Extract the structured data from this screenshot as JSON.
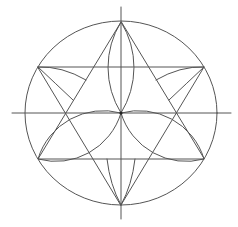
{
  "diagram": {
    "title": "",
    "colors": {
      "background": "#ffffff",
      "stroke": "#555555",
      "center_dot": "#222222"
    },
    "center": [
      121,
      113
    ],
    "circle": {
      "cx": 121,
      "cy": 113,
      "rx": 96,
      "ry": 92
    },
    "axes": {
      "horizontal": [
        12,
        113,
        231,
        113
      ],
      "vertical": [
        121,
        7,
        121,
        219
      ]
    },
    "triangle_up": [
      [
        121,
        22
      ],
      [
        38,
        159
      ],
      [
        204,
        159
      ]
    ],
    "triangle_down": [
      [
        38,
        67
      ],
      [
        204,
        67
      ],
      [
        121,
        205
      ]
    ],
    "petals": [
      {
        "from": [
          121,
          113
        ],
        "to": [
          121,
          22
        ],
        "r": 86
      },
      {
        "from": [
          121,
          113
        ],
        "to": [
          38,
          159
        ],
        "r": 68
      },
      {
        "from": [
          121,
          113
        ],
        "to": [
          204,
          159
        ],
        "r": 68
      }
    ],
    "outer_arcs": [
      {
        "d": "M38,67 Q62,66 86,80"
      },
      {
        "d": "M38,67 Q56,84 73,100"
      },
      {
        "d": "M204,67 Q180,66 156,80"
      },
      {
        "d": "M204,67 Q186,84 169,100"
      },
      {
        "d": "M107,159 Q110,185 121,205"
      },
      {
        "d": "M135,159 Q132,185 121,205"
      }
    ]
  }
}
